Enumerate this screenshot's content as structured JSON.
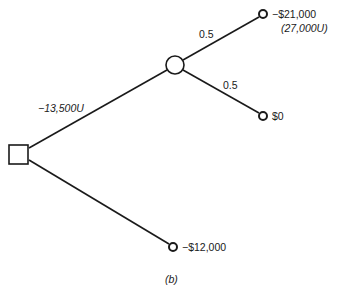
{
  "diagram": {
    "type": "decision-tree",
    "caption": "(b)",
    "decision_node": {
      "shape": "square"
    },
    "chance_node": {
      "shape": "circle"
    },
    "branches": {
      "upper_decision": {
        "label": "−13,500U"
      },
      "chance_up": {
        "probability": "0.5",
        "outcome": "−$21,000",
        "utility": "(27,000U)"
      },
      "chance_down": {
        "probability": "0.5",
        "outcome": "$0"
      },
      "lower_decision": {
        "outcome": "−$12,000"
      }
    }
  }
}
